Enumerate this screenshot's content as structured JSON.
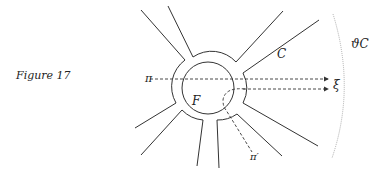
{
  "caption": "Figure 17",
  "labels": {
    "pi": "π",
    "pi_prime": "π′",
    "xi": "ξ",
    "F": "F",
    "C": "C",
    "boundary_C": "ϑC"
  },
  "colors": {
    "stroke": "#333333",
    "dotted_arc": "#999999"
  }
}
